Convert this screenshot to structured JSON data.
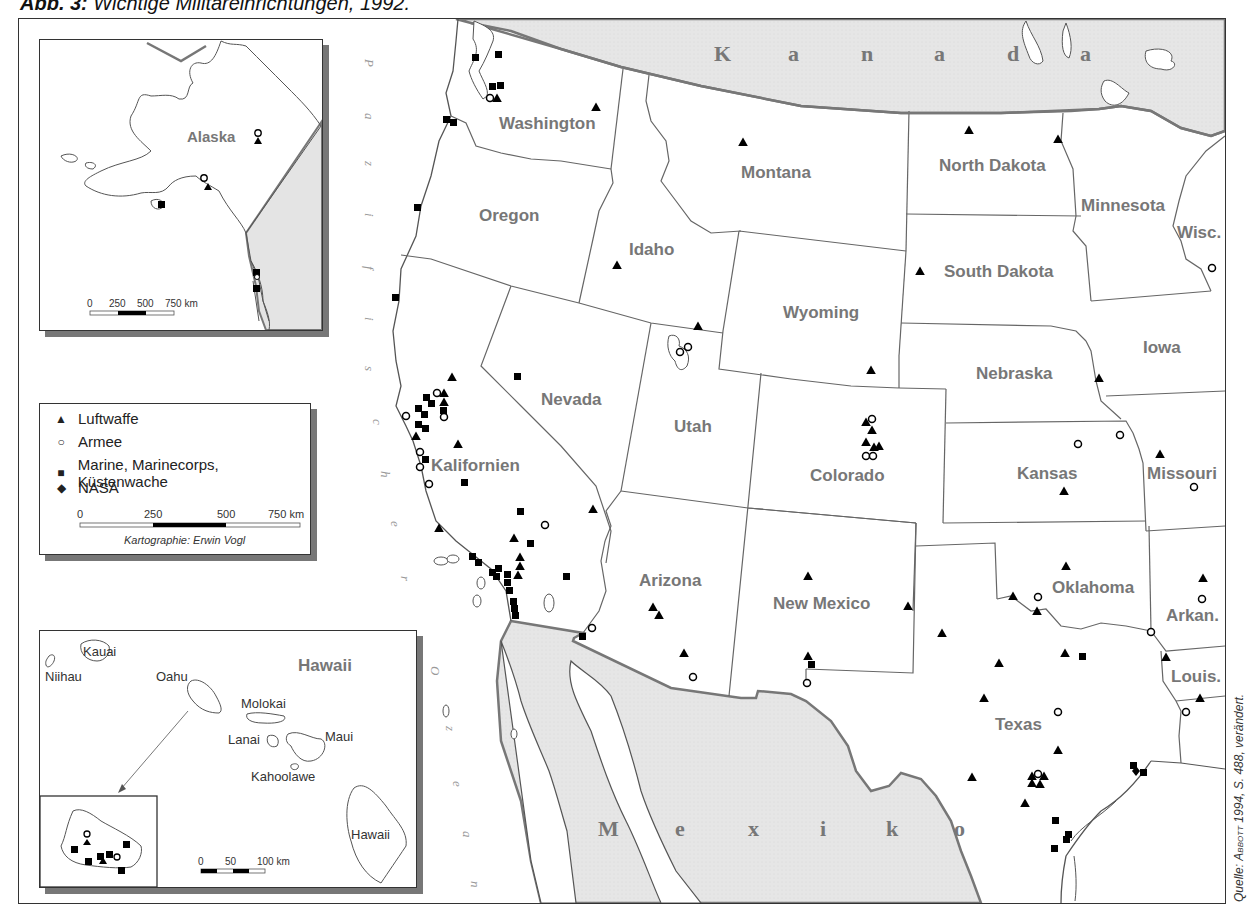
{
  "figure": {
    "title_prefix": "Abb. 3:",
    "title_text": "Wichtige Militäreinrichtungen, 1992.",
    "source_prefix": "Quelle: ",
    "source_author": "Abbott",
    "source_suffix": " 1994, S. 488, verändert."
  },
  "legend": {
    "items": [
      {
        "symbol": "triangle",
        "glyph": "▲",
        "label": "Luftwaffe"
      },
      {
        "symbol": "circle",
        "glyph": "○",
        "label": "Armee"
      },
      {
        "symbol": "square",
        "glyph": "■",
        "label": "Marine, Marinecorps, Küstenwache"
      },
      {
        "symbol": "diamond",
        "glyph": "◆",
        "label": "NASA"
      }
    ],
    "scale": {
      "ticks": [
        "0",
        "250",
        "500",
        "750 km"
      ]
    },
    "credit": "Kartographie: Erwin Vogl"
  },
  "alaska_inset": {
    "label": "Alaska",
    "scale": {
      "ticks": [
        "0",
        "250",
        "500",
        "750 km"
      ]
    }
  },
  "hawaii_inset": {
    "title": "Hawaii",
    "islands": [
      "Niihau",
      "Kauai",
      "Oahu",
      "Molokai",
      "Lanai",
      "Maui",
      "Kahoolawe",
      "Hawaii"
    ],
    "scale": {
      "ticks": [
        "0",
        "50",
        "100 km"
      ]
    }
  },
  "countries": {
    "north": [
      "K",
      "a",
      "n",
      "a",
      "d",
      "a"
    ],
    "south": [
      "M",
      "e",
      "x",
      "i",
      "k",
      "o"
    ]
  },
  "ocean": {
    "word1": [
      "P",
      "a",
      "z",
      "i",
      "f",
      "i",
      "s",
      "c",
      "h",
      "e",
      "r"
    ],
    "word2": [
      "O",
      "z",
      "e",
      "a",
      "n"
    ]
  },
  "states": {
    "washington": "Washington",
    "oregon": "Oregon",
    "idaho": "Idaho",
    "montana": "Montana",
    "north_dakota": "North Dakota",
    "minnesota": "Minnesota",
    "wisconsin": "Wisc.",
    "south_dakota": "South Dakota",
    "wyoming": "Wyoming",
    "iowa": "Iowa",
    "nebraska": "Nebraska",
    "nevada": "Nevada",
    "utah": "Utah",
    "colorado": "Colorado",
    "kansas": "Kansas",
    "missouri": "Missouri",
    "california": "Kalifornien",
    "arizona": "Arizona",
    "new_mexico": "New Mexico",
    "oklahoma": "Oklahoma",
    "arkansas": "Arkan.",
    "louisiana": "Louis.",
    "texas": "Texas"
  },
  "colors": {
    "land_foreign": "#e4e4e4",
    "border_national": "#777777",
    "border_state": "#666666",
    "label": "#777777",
    "symbol": "#000000"
  }
}
